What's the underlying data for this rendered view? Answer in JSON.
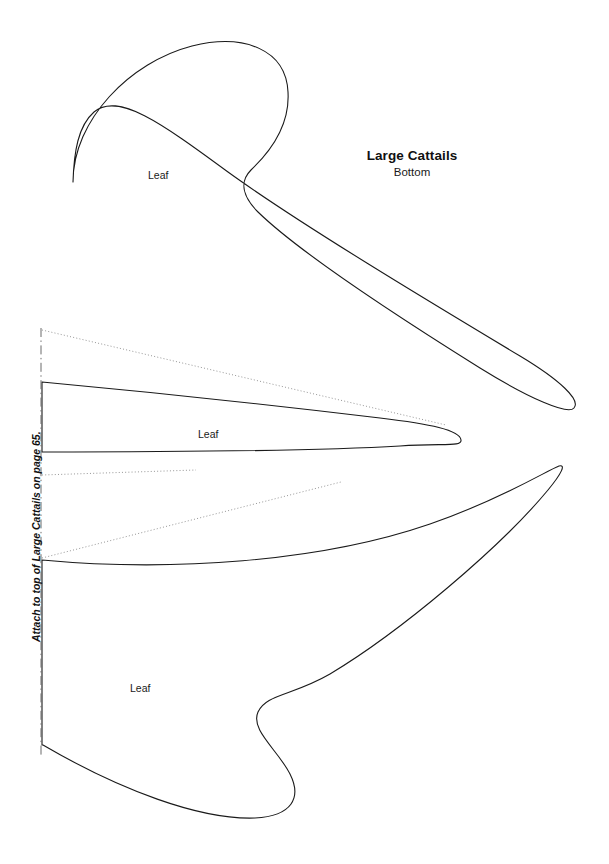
{
  "page": {
    "width": 609,
    "height": 864,
    "background_color": "#ffffff",
    "outline_color": "#1a1a1a",
    "guide_color": "#8a8a8a",
    "fold_color": "#6b6b6b"
  },
  "title": {
    "main": "Large Cattails",
    "sub": "Bottom"
  },
  "labels": {
    "leaf_top": "Leaf",
    "leaf_middle": "Leaf",
    "leaf_bottom": "Leaf",
    "fold_note": "Attach to top of Large Cattails on page 65."
  },
  "shapes": {
    "leaf_top": {
      "name": "Leaf",
      "path": "M 73 182 C 73 120 130 62 192 46 C 245 33 286 50 288 92 C 290 125 270 152 251 170 C 239 182 243 197 258 212 C 300 253 400 318 480 368 C 530 399 568 415 574 408 C 581 400 560 380 520 356 C 430 302 300 224 228 172 C 160 122 118 92 94 112 C 78 126 74 152 73 182 Z"
    },
    "leaf_middle": {
      "name": "Leaf",
      "path": "M 42 382 L 42 452 C 140 452 300 452 400 446 C 444 443 462 447 461 440 C 460 430 430 424 380 418 C 280 406 150 392 42 382 Z"
    },
    "leaf_bottom": {
      "name": "Leaf",
      "path": "M 42 560 L 42 745 L 43 745 C 120 790 200 820 255 818 C 292 816 302 798 290 774 C 278 750 250 730 258 712 C 266 694 292 696 330 674 C 400 632 500 548 548 490 C 562 473 566 464 559 466 C 548 470 500 500 430 524 C 320 562 170 572 42 560 Z"
    }
  },
  "guides": {
    "upper_dotted": {
      "x1": 42,
      "y1": 330,
      "x2": 446,
      "y2": 425
    },
    "short_dotted": {
      "x1": 42,
      "y1": 475,
      "x2": 196,
      "y2": 470
    },
    "lower_dotted": {
      "x1": 42,
      "y1": 558,
      "x2": 341,
      "y2": 482
    }
  },
  "fold": {
    "x": 41,
    "y_start": 328,
    "y_end": 757
  }
}
